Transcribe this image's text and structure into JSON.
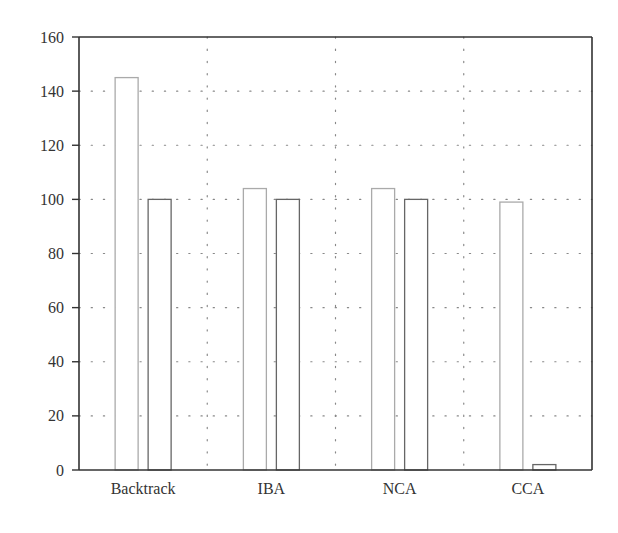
{
  "chart_data": {
    "type": "bar",
    "title": "",
    "xlabel": "",
    "ylabel": "",
    "categories": [
      "Backtrack",
      "IBA",
      "NCA",
      "CCA"
    ],
    "series": [
      {
        "name": "Series 1",
        "values": [
          145,
          104,
          104,
          99
        ],
        "stroke": "#aaaaaa",
        "fill": "#ffffff"
      },
      {
        "name": "Series 2",
        "values": [
          100,
          100,
          100,
          2
        ],
        "stroke": "#666666",
        "fill": "#ffffff"
      }
    ],
    "ylim": [
      0,
      160
    ],
    "yticks": [
      0,
      20,
      40,
      60,
      80,
      100,
      120,
      140,
      160
    ],
    "grid": {
      "horizontal": true,
      "vertical": true,
      "style": "dotted"
    },
    "legend": null
  },
  "colors": {
    "axis": "#333333",
    "grid": "#888888"
  }
}
